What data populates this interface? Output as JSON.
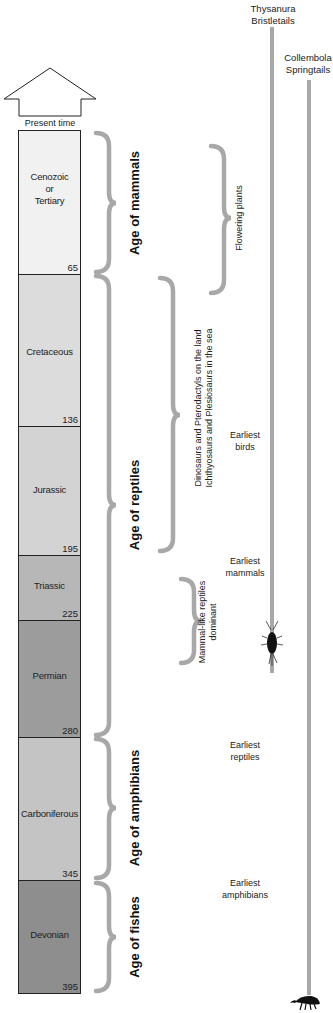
{
  "present_time": "Present time",
  "periods": [
    {
      "name_lines": [
        "Cenozoic",
        "or",
        "Tertiary"
      ],
      "end_mya": "65",
      "color": "#f1f1f1"
    },
    {
      "name": "Cretaceous",
      "end_mya": "136",
      "color": "#dcdcdc"
    },
    {
      "name": "Jurassic",
      "end_mya": "195",
      "color": "#d3d3d3"
    },
    {
      "name": "Triassic",
      "end_mya": "225",
      "color": "#b7b7b7"
    },
    {
      "name": "Permian",
      "end_mya": "280",
      "color": "#9c9c9c"
    },
    {
      "name": "Carboniferous",
      "end_mya": "345",
      "color": "#c4c4c4"
    },
    {
      "name": "Devonian",
      "end_mya": "395",
      "color": "#8e8e8e"
    }
  ],
  "ages": [
    {
      "label": "Age of mammals"
    },
    {
      "label": "Age of reptiles"
    },
    {
      "label": "Age of amphibians"
    },
    {
      "label": "Age of fishes"
    }
  ],
  "notes": {
    "flowering_plants": "Flowering plants",
    "dinosaurs_line1": "Dinosaurs and Pterodactyls on the land",
    "dinosaurs_line2": "Ichthyosaurs and Plesiosaurs in the sea",
    "mammal_like_line1": "Mammal-like reptiles",
    "mammal_like_line2": "dominant"
  },
  "events": [
    {
      "line1": "Earliest",
      "line2": "birds"
    },
    {
      "line1": "Earliest",
      "line2": "mammals"
    },
    {
      "line1": "Earliest",
      "line2": "reptiles"
    },
    {
      "line1": "Earliest",
      "line2": "amphibians"
    }
  ],
  "lineages": [
    {
      "line1": "Thysanura",
      "line2": "Bristletails"
    },
    {
      "line1": "Collembola",
      "line2": "Springtails"
    }
  ],
  "colors": {
    "bracket": "#a8a8a8",
    "lineage": "#a8a8a8",
    "border": "#222222"
  }
}
